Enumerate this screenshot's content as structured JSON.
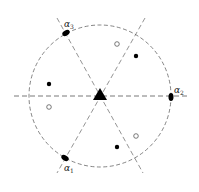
{
  "diagram": {
    "type": "root-system",
    "center": {
      "x": 100,
      "y": 96
    },
    "circle_radius": 71,
    "colors": {
      "stroke": "#555555",
      "fill": "#000000",
      "background": "#ffffff"
    },
    "labels": {
      "alpha3": {
        "base": "α",
        "sub": "3"
      },
      "alpha2": {
        "base": "α",
        "sub": "2"
      },
      "alpha1": {
        "base": "α",
        "sub": "1"
      }
    },
    "roots": [
      {
        "name": "alpha3",
        "x": 66,
        "y": 33
      },
      {
        "name": "alpha2",
        "x": 171,
        "y": 97
      },
      {
        "name": "alpha1",
        "x": 65,
        "y": 158
      }
    ],
    "filled_points": [
      {
        "x": 136,
        "y": 56
      },
      {
        "x": 49,
        "y": 84
      },
      {
        "x": 117,
        "y": 147
      }
    ],
    "open_points": [
      {
        "x": 117,
        "y": 44
      },
      {
        "x": 49,
        "y": 107
      },
      {
        "x": 136,
        "y": 136
      }
    ]
  }
}
